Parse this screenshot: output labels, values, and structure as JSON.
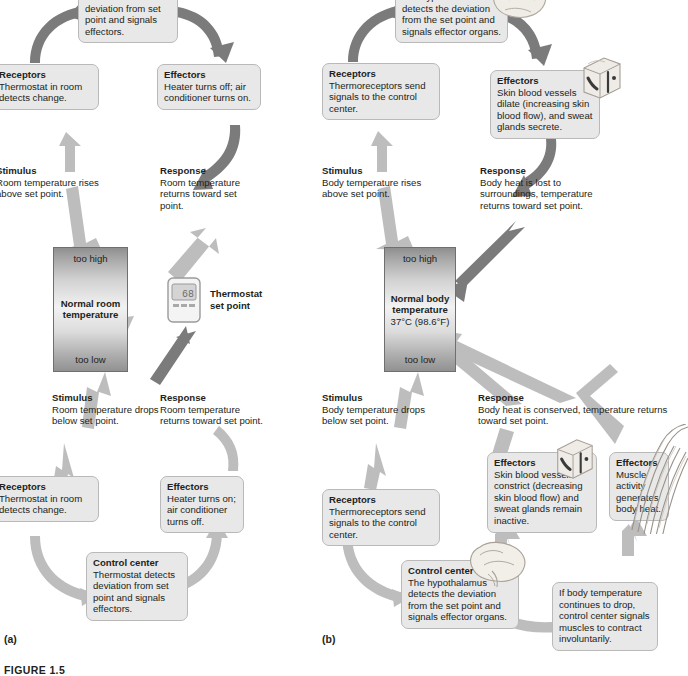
{
  "figure": {
    "caption": "FIGURE 1.5",
    "panel_a_letter": "(a)",
    "panel_b_letter": "(b)"
  },
  "panel_a": {
    "name": "thermostat-negative-feedback",
    "set_point_box": {
      "too_high": "too high",
      "title": "Normal room",
      "title2": "temperature",
      "too_low": "too low"
    },
    "thermostat_icon": {
      "label_line1": "Thermostat",
      "label_line2": "set point",
      "display_value": "68"
    },
    "upper_loop": {
      "stimulus": {
        "head": "Stimulus",
        "body": "Room temperature rises above set point."
      },
      "receptors": {
        "head": "Receptors",
        "body": "Thermostat in room detects change."
      },
      "control_center": {
        "head": "",
        "body": "Thermostat detects deviation from set point and signals effectors."
      },
      "effectors": {
        "head": "Effectors",
        "body": "Heater turns off; air conditioner turns on."
      },
      "response": {
        "head": "Response",
        "body": "Room temperature returns toward set point."
      }
    },
    "lower_loop": {
      "stimulus": {
        "head": "Stimulus",
        "body": "Room temperature drops below set point."
      },
      "receptors": {
        "head": "Receptors",
        "body": "Thermostat in room detects change."
      },
      "control_center": {
        "head": "Control center",
        "body": "Thermostat detects deviation from set point and signals effectors."
      },
      "effectors": {
        "head": "Effectors",
        "body": "Heater turns on; air conditioner turns off."
      },
      "response": {
        "head": "Response",
        "body": "Room temperature returns toward set point."
      }
    }
  },
  "panel_b": {
    "name": "body-temperature-negative-feedback",
    "set_point_box": {
      "too_high": "too high",
      "title": "Normal body",
      "title2": "temperature",
      "value": "37°C (98.6°F)",
      "too_low": "too low"
    },
    "upper_loop": {
      "stimulus": {
        "head": "Stimulus",
        "body": "Body temperature rises above set point."
      },
      "receptors": {
        "head": "Receptors",
        "body": "Thermoreceptors send signals to the control center."
      },
      "control_center": {
        "head": "",
        "body": "The hypothalamus detects the deviation from the set point and signals effector organs."
      },
      "effectors": {
        "head": "Effectors",
        "body": "Skin blood vessels dilate (increasing skin blood flow), and sweat glands secrete."
      },
      "response": {
        "head": "Response",
        "body": "Body heat is lost to surroundings, temperature returns toward set point."
      }
    },
    "lower_loop": {
      "stimulus": {
        "head": "Stimulus",
        "body": "Body temperature drops below set point."
      },
      "receptors": {
        "head": "Receptors",
        "body": "Thermoreceptors send signals to the control center."
      },
      "control_center": {
        "head": "Control center",
        "body": "The hypothalamus detects the deviation from the set point and signals effector organs."
      },
      "effectors_skin": {
        "head": "Effectors",
        "body": "Skin blood vessels constrict (decreasing skin blood flow) and sweat glands remain inactive."
      },
      "effectors_muscle": {
        "head": "Effectors",
        "body": "Muscle activity generates body heat."
      },
      "shivering_note": {
        "head": "",
        "body": "If body temperature continues to drop, control center signals muscles to contract involuntarily."
      },
      "response": {
        "head": "Response",
        "body": "Body heat is conserved, temperature returns toward set point."
      }
    }
  },
  "colors": {
    "box_fill": "#e8e8e8",
    "box_border": "#b9b9b9",
    "arrow_dark": "#7b7b7b",
    "arrow_light": "#bdbdbd",
    "text": "#231f20",
    "temp_border": "#6f6f6f"
  },
  "icons": {
    "thermostat": "thermostat-icon",
    "skin_block_upper": "skin-block-icon",
    "skin_block_lower": "skin-block-icon",
    "brain_top": "brain-icon",
    "brain_bottom": "brain-icon",
    "muscle": "muscle-fiber-icon"
  }
}
